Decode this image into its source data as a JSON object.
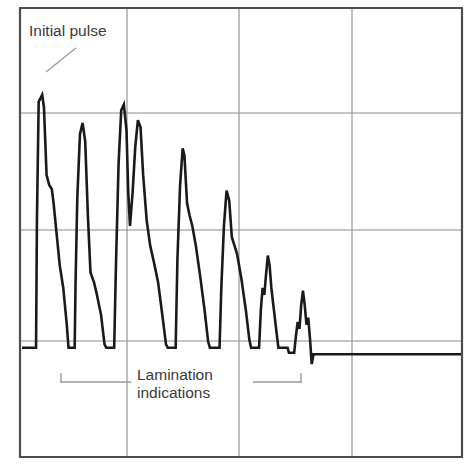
{
  "chart_data": {
    "type": "line",
    "title": "",
    "subtitle": "",
    "xlabel": "",
    "ylabel": "",
    "xlim": [
      0,
      100
    ],
    "ylim": [
      0,
      100
    ],
    "grid": true,
    "grid_x_ticks": [
      24,
      49,
      75
    ],
    "grid_y_ticks": [
      23,
      49,
      74
    ],
    "legend": "none",
    "series": [
      {
        "name": "A-scan ultrasonic echo trace",
        "color": "#1a1a1a",
        "points": [
          [
            0.0,
            0.8
          ],
          [
            3.2,
            0.8
          ],
          [
            3.4,
            46.0
          ],
          [
            3.8,
            88.0
          ],
          [
            4.6,
            90.5
          ],
          [
            5.0,
            86.0
          ],
          [
            5.6,
            62.0
          ],
          [
            6.2,
            58.5
          ],
          [
            6.8,
            57.0
          ],
          [
            7.2,
            52.0
          ],
          [
            8.6,
            30.0
          ],
          [
            9.4,
            22.0
          ],
          [
            10.2,
            9.0
          ],
          [
            10.6,
            0.8
          ],
          [
            12.0,
            0.8
          ],
          [
            12.2,
            24.0
          ],
          [
            12.6,
            54.0
          ],
          [
            13.2,
            76.5
          ],
          [
            13.8,
            80.5
          ],
          [
            14.4,
            74.0
          ],
          [
            15.0,
            48.0
          ],
          [
            15.6,
            27.5
          ],
          [
            16.4,
            24.0
          ],
          [
            17.0,
            20.0
          ],
          [
            18.0,
            12.5
          ],
          [
            18.8,
            2.0
          ],
          [
            19.2,
            0.8
          ],
          [
            21.0,
            0.8
          ],
          [
            21.4,
            30.0
          ],
          [
            22.0,
            66.0
          ],
          [
            22.6,
            85.0
          ],
          [
            23.2,
            87.0
          ],
          [
            23.8,
            78.0
          ],
          [
            24.2,
            56.0
          ],
          [
            24.6,
            44.0
          ],
          [
            25.2,
            56.0
          ],
          [
            25.8,
            72.0
          ],
          [
            26.4,
            81.5
          ],
          [
            27.0,
            79.0
          ],
          [
            27.6,
            62.0
          ],
          [
            28.4,
            46.0
          ],
          [
            29.2,
            37.0
          ],
          [
            30.0,
            31.5
          ],
          [
            31.0,
            24.0
          ],
          [
            32.0,
            12.0
          ],
          [
            32.8,
            2.0
          ],
          [
            33.2,
            0.8
          ],
          [
            35.0,
            0.8
          ],
          [
            35.4,
            32.0
          ],
          [
            36.0,
            58.0
          ],
          [
            36.6,
            71.5
          ],
          [
            37.0,
            69.0
          ],
          [
            37.6,
            52.0
          ],
          [
            38.2,
            47.5
          ],
          [
            38.8,
            44.0
          ],
          [
            39.6,
            37.0
          ],
          [
            40.6,
            26.0
          ],
          [
            41.6,
            14.0
          ],
          [
            42.4,
            3.0
          ],
          [
            42.8,
            0.8
          ],
          [
            45.0,
            0.8
          ],
          [
            45.4,
            22.0
          ],
          [
            46.0,
            44.0
          ],
          [
            46.6,
            56.5
          ],
          [
            47.2,
            53.0
          ],
          [
            47.8,
            40.0
          ],
          [
            48.4,
            37.0
          ],
          [
            49.0,
            34.0
          ],
          [
            50.0,
            25.0
          ],
          [
            51.0,
            14.0
          ],
          [
            51.8,
            3.5
          ],
          [
            52.2,
            0.8
          ],
          [
            54.0,
            0.8
          ],
          [
            54.4,
            14.0
          ],
          [
            54.8,
            22.0
          ],
          [
            55.2,
            19.5
          ],
          [
            55.6,
            27.0
          ],
          [
            56.0,
            33.5
          ],
          [
            56.4,
            30.0
          ],
          [
            56.8,
            22.0
          ],
          [
            57.4,
            14.0
          ],
          [
            58.0,
            6.0
          ],
          [
            58.4,
            0.8
          ],
          [
            60.5,
            0.8
          ],
          [
            60.8,
            -1.0
          ],
          [
            62.0,
            -1.0
          ],
          [
            62.4,
            5.0
          ],
          [
            62.8,
            10.0
          ],
          [
            63.2,
            7.5
          ],
          [
            63.6,
            16.0
          ],
          [
            64.0,
            21.0
          ],
          [
            64.4,
            16.0
          ],
          [
            64.8,
            9.0
          ],
          [
            65.2,
            11.5
          ],
          [
            65.6,
            4.0
          ],
          [
            66.0,
            -5.0
          ],
          [
            66.4,
            -1.5
          ],
          [
            67.5,
            -1.5
          ],
          [
            100.0,
            -1.5
          ]
        ]
      }
    ],
    "annotations": [
      {
        "id": "initial-pulse",
        "text": "Initial pulse",
        "leader_from": [
          12.5,
          95.0
        ],
        "leader_to": [
          4.5,
          90.5
        ]
      },
      {
        "id": "lamination-indications",
        "text_line1": "Lamination",
        "text_line2": "indications",
        "bracket_from": 9.5,
        "bracket_to": 65.0
      }
    ]
  },
  "annotations": {
    "initial_pulse": "Initial pulse",
    "lamination_line1": "Lamination",
    "lamination_line2": "indications"
  },
  "style": {
    "frame_color": "#4d4d4d",
    "grid_color": "#8c8c8c",
    "trace_color": "#1a1a1a",
    "leader_color": "#9a9a9a",
    "bracket_color": "#9a9a9a",
    "text_color": "#3a3a3a",
    "background": "#ffffff"
  }
}
